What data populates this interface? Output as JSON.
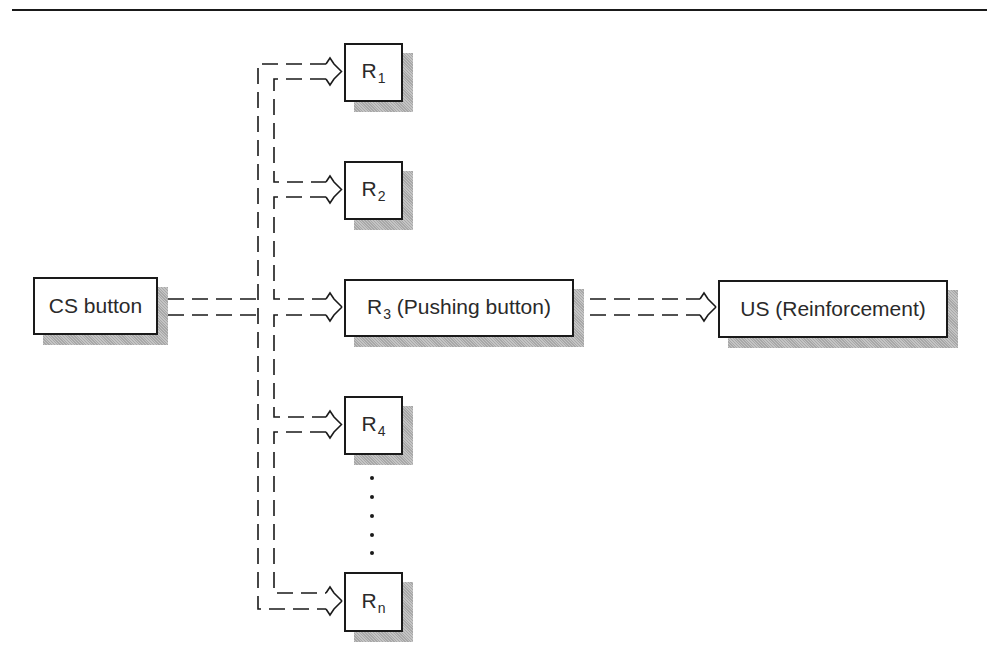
{
  "diagram": {
    "type": "flow",
    "nodes": {
      "cs": {
        "label": "CS button"
      },
      "r1": {
        "base": "R",
        "sub": "1"
      },
      "r2": {
        "base": "R",
        "sub": "2"
      },
      "r3": {
        "base": "R",
        "sub": "3",
        "suffix": " (Pushing button)"
      },
      "r4": {
        "base": "R",
        "sub": "4"
      },
      "rn": {
        "base": "R",
        "sub": "n"
      },
      "us": {
        "label": "US (Reinforcement)"
      }
    },
    "edges": [
      {
        "from": "CS button",
        "to": "R1",
        "style": "double-dashed"
      },
      {
        "from": "CS button",
        "to": "R2",
        "style": "double-dashed"
      },
      {
        "from": "CS button",
        "to": "R3 (Pushing button)",
        "style": "double-dashed"
      },
      {
        "from": "CS button",
        "to": "R4",
        "style": "double-dashed"
      },
      {
        "from": "CS button",
        "to": "Rn",
        "style": "double-dashed"
      },
      {
        "from": "R3 (Pushing button)",
        "to": "US (Reinforcement)",
        "style": "double-dashed"
      }
    ],
    "ellipsis": "vertical dots between R4 and Rn"
  }
}
